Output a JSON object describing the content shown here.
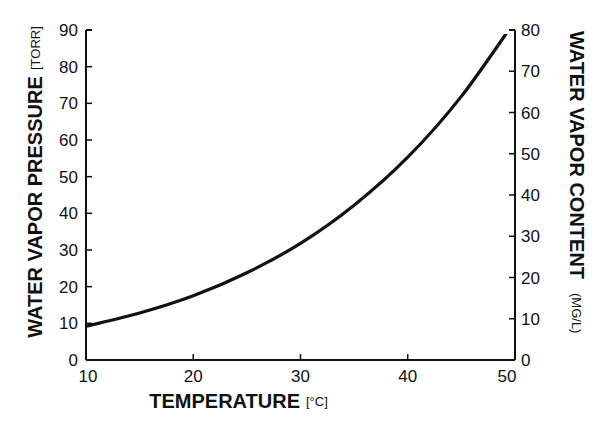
{
  "chart_data": {
    "type": "line",
    "title": "",
    "xlabel": "TEMPERATURE",
    "xunit": "[°C]",
    "ylabel": "WATER VAPOR PRESSURE",
    "yunit": "[TORR]",
    "y2label": "WATER VAPOR CONTENT",
    "y2unit": "(MG/L)",
    "xlim": [
      10,
      50
    ],
    "ylim": [
      0,
      90
    ],
    "y2lim": [
      0,
      80
    ],
    "xticks": [
      10,
      20,
      30,
      40,
      50
    ],
    "yticks": [
      0,
      10,
      20,
      30,
      40,
      50,
      60,
      70,
      80,
      90
    ],
    "y2ticks": [
      0,
      10,
      20,
      30,
      40,
      50,
      60,
      70,
      80
    ],
    "grid": false,
    "legend": null,
    "series": [
      {
        "name": "Water vapor pressure",
        "x": [
          10,
          15,
          20,
          25,
          30,
          35,
          40,
          45,
          50
        ],
        "values": [
          9.2,
          12.8,
          17.5,
          23.8,
          31.8,
          42.2,
          55.3,
          71.9,
          92.5
        ]
      }
    ]
  },
  "labels": {
    "x_title": "TEMPERATURE",
    "x_unit": "[°C]",
    "y_title": "WATER VAPOR PRESSURE",
    "y_unit": "[TORR]",
    "y2_title": "WATER VAPOR CONTENT",
    "y2_unit": "(MG/L)"
  },
  "style": {
    "line_color": "#111111",
    "axis_color": "#111111"
  }
}
